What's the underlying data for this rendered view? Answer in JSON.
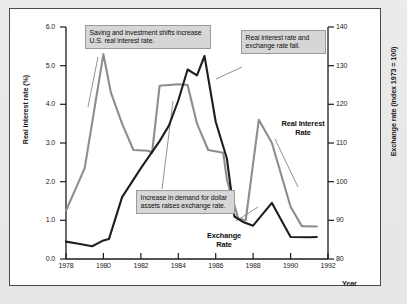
{
  "figure": {
    "background_color": "#e8e8e8",
    "panel_color": "#ffffff",
    "border_color": "#4a4a4a"
  },
  "axes": {
    "left_title": "Real interest rate (%)",
    "right_title": "Exchange rate (index 1973 = 100)",
    "x_title": "Year",
    "left_ticks": [
      "0.0",
      "1.0",
      "2.0",
      "3.0",
      "4.0",
      "5.0",
      "6.0"
    ],
    "right_ticks": [
      "80",
      "90",
      "100",
      "110",
      "120",
      "130",
      "140"
    ],
    "x_ticks": [
      "1978",
      "1980",
      "1982",
      "1984",
      "1986",
      "1988",
      "1990",
      "1992"
    ]
  },
  "annotations": {
    "saving": "Saving and investment shifts increase U.S. real interest rate.",
    "fall": "Real interest rate and exchange rate fall.",
    "demand": "Increase in demand for dollar assets raises exchange rate."
  },
  "series_labels": {
    "real_interest_rate": "Real Interest\nRate",
    "exchange_rate": "Exchange\nRate"
  },
  "chart_data": {
    "type": "line",
    "title": "",
    "xlabel": "Year",
    "ylabel": "Real interest rate (%)",
    "y2label": "Exchange rate (index 1973 = 100)",
    "xlim": [
      1978,
      1992
    ],
    "ylim": [
      0.0,
      6.0
    ],
    "y2lim": [
      80,
      140
    ],
    "grid": false,
    "legend": "inline-labels",
    "series": [
      {
        "name": "Real Interest Rate",
        "axis": "left",
        "color": "#1e1e1e",
        "linewidth": 2.1,
        "points": [
          [
            1978.0,
            0.45
          ],
          [
            1978.6,
            0.4
          ],
          [
            1979.4,
            0.33
          ],
          [
            1980.0,
            0.48
          ],
          [
            1980.3,
            0.52
          ],
          [
            1981.0,
            1.6
          ],
          [
            1982.0,
            2.35
          ],
          [
            1983.0,
            3.05
          ],
          [
            1983.5,
            3.45
          ],
          [
            1984.0,
            4.1
          ],
          [
            1984.5,
            4.9
          ],
          [
            1985.0,
            4.75
          ],
          [
            1985.4,
            5.25
          ],
          [
            1986.0,
            3.55
          ],
          [
            1986.6,
            2.6
          ],
          [
            1987.0,
            1.1
          ],
          [
            1987.5,
            0.95
          ],
          [
            1988.0,
            0.86
          ],
          [
            1989.0,
            1.45
          ],
          [
            1990.0,
            0.57
          ],
          [
            1991.0,
            0.56
          ],
          [
            1991.4,
            0.57
          ]
        ]
      },
      {
        "name": "Exchange Rate",
        "axis": "right",
        "color": "#8d8d8d",
        "linewidth": 2.1,
        "points_left_scale": [
          [
            1978.0,
            1.25
          ],
          [
            1979.0,
            2.35
          ],
          [
            1980.0,
            5.3
          ],
          [
            1980.4,
            4.3
          ],
          [
            1981.0,
            3.5
          ],
          [
            1981.6,
            2.82
          ],
          [
            1982.4,
            2.8
          ],
          [
            1982.6,
            2.75
          ],
          [
            1983.0,
            4.48
          ],
          [
            1984.0,
            4.52
          ],
          [
            1984.5,
            4.5
          ],
          [
            1985.0,
            3.5
          ],
          [
            1985.6,
            2.82
          ],
          [
            1986.4,
            2.75
          ],
          [
            1986.6,
            2.05
          ],
          [
            1987.2,
            1.05
          ],
          [
            1987.6,
            1.0
          ],
          [
            1988.3,
            3.6
          ],
          [
            1989.0,
            3.0
          ],
          [
            1990.0,
            1.35
          ],
          [
            1990.6,
            0.85
          ],
          [
            1991.4,
            0.84
          ]
        ],
        "points_right_scale": [
          [
            1978.0,
            92.5
          ],
          [
            1979.0,
            104.0
          ],
          [
            1980.0,
            133.0
          ],
          [
            1980.4,
            123.0
          ],
          [
            1981.0,
            115.0
          ],
          [
            1981.6,
            108.2
          ],
          [
            1982.4,
            108.0
          ],
          [
            1982.6,
            107.5
          ],
          [
            1983.0,
            124.8
          ],
          [
            1984.0,
            125.2
          ],
          [
            1984.5,
            125.0
          ],
          [
            1985.0,
            115.0
          ],
          [
            1985.6,
            108.2
          ],
          [
            1986.4,
            107.5
          ],
          [
            1986.6,
            100.5
          ],
          [
            1987.2,
            90.5
          ],
          [
            1987.6,
            90.0
          ],
          [
            1988.3,
            116.0
          ],
          [
            1989.0,
            110.0
          ],
          [
            1990.0,
            93.5
          ],
          [
            1990.6,
            88.5
          ],
          [
            1991.4,
            88.4
          ]
        ]
      }
    ]
  }
}
